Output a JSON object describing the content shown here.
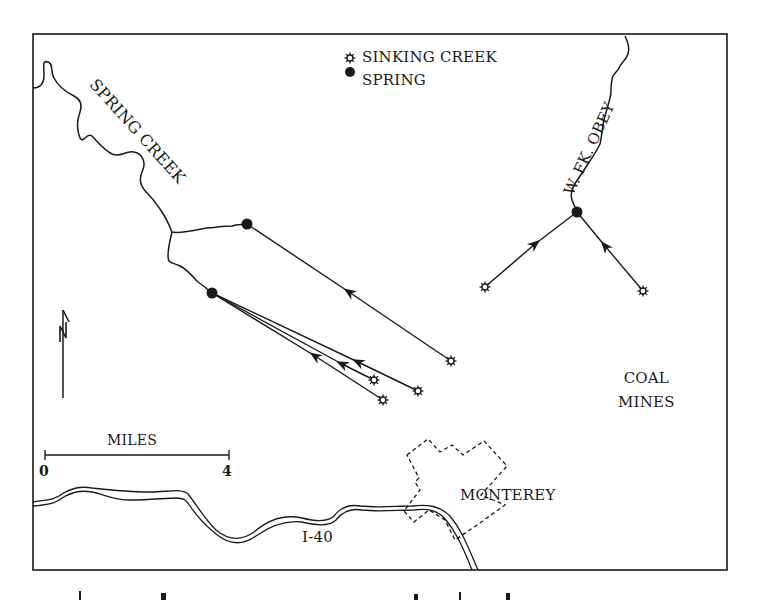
{
  "map": {
    "legend": {
      "items": [
        {
          "symbol": "star-open",
          "label": "SINKING CREEK"
        },
        {
          "symbol": "filled-circle",
          "label": "SPRING"
        }
      ]
    },
    "labels": {
      "spring_creek": "SPRING CREEK",
      "w_fk_obey": "W. FK. OBEY",
      "coal_mines_line1": "COAL",
      "coal_mines_line2": "MINES",
      "monterey": "MONTEREY",
      "highway": "I-40"
    },
    "scale_bar": {
      "title": "MILES",
      "start": "0",
      "end": "4"
    },
    "north_arrow": {
      "label": "N"
    },
    "features": {
      "springs": [
        {
          "name": "spring-creek-spring-upper",
          "x": 247,
          "y": 224
        },
        {
          "name": "spring-creek-spring-lower",
          "x": 212,
          "y": 293
        },
        {
          "name": "w-fk-obey-spring",
          "x": 577,
          "y": 212
        }
      ],
      "sinking_creeks": [
        {
          "x": 451,
          "y": 361,
          "drains_to": "spring-creek-spring-upper"
        },
        {
          "x": 374,
          "y": 380,
          "drains_to": "spring-creek-spring-lower"
        },
        {
          "x": 418,
          "y": 391,
          "drains_to": "spring-creek-spring-lower"
        },
        {
          "x": 383,
          "y": 400,
          "drains_to": "spring-creek-spring-lower"
        },
        {
          "x": 485,
          "y": 287,
          "drains_to": "w-fk-obey-spring"
        },
        {
          "x": 643,
          "y": 291,
          "drains_to": "w-fk-obey-spring"
        }
      ]
    }
  }
}
